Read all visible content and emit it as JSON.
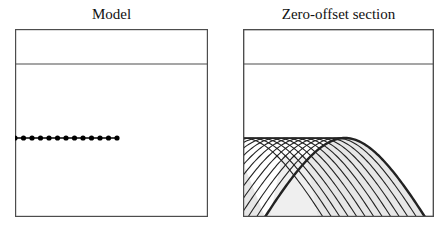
{
  "figure": {
    "kind": "seismic-model-and-zero-offset-section-diagram",
    "panels": [
      {
        "id": "model",
        "title": "Model",
        "frame": {
          "x": 15,
          "y": 29,
          "width": 193,
          "height": 188
        },
        "colors": {
          "border": "#4d4d4d",
          "background": "#ffffff",
          "ink": "#000000"
        }
      },
      {
        "id": "zero-offset-section",
        "title": "Zero-offset section",
        "frame": {
          "x": 243,
          "y": 29,
          "width": 191,
          "height": 188
        },
        "colors": {
          "border": "#4d4d4d",
          "background": "#ffffff",
          "fill": "#e7e7e7",
          "inner_fill": "#efefef",
          "curve": "#222222"
        }
      }
    ]
  },
  "chart_data": {
    "type": "scatter",
    "xlabel": "",
    "ylabel": "",
    "grid": false,
    "legend": "none",
    "panels": [
      {
        "name": "Model",
        "title": "Model",
        "xlim": [
          0,
          193
        ],
        "ylim": [
          0,
          188
        ],
        "elements": {
          "interface_line": {
            "description": "horizontal layer interface",
            "y": 35,
            "x_start": 0,
            "x_end": 193
          },
          "scatterer_points": {
            "description": "row of point diffractors",
            "y": 109,
            "count": 13,
            "x_start": 0,
            "x_end": 102,
            "spacing": 8.5,
            "marker_radius": 2.6,
            "x_values": [
              0,
              8.5,
              17,
              25.5,
              34,
              42.5,
              51,
              59.5,
              68,
              76.5,
              85,
              93.5,
              102
            ],
            "y_values": [
              109,
              109,
              109,
              109,
              109,
              109,
              109,
              109,
              109,
              109,
              109,
              109,
              109
            ]
          }
        }
      },
      {
        "name": "Zero-offset section",
        "title": "Zero-offset section",
        "xlim": [
          0,
          191
        ],
        "ylim": [
          0,
          188
        ],
        "elements": {
          "interface_line": {
            "description": "horizontal layer interface reflection",
            "y": 35,
            "x_start": 0,
            "x_end": 191
          },
          "diffraction_hyperbolas": {
            "description": "diffraction hyperbolas, one per point scatterer, apexes along a flat top at the scatterer depth",
            "count": 13,
            "apex_y": 109,
            "apex_x_values": [
              0,
              8.5,
              17,
              25.5,
              34,
              42.5,
              51,
              59.5,
              68,
              76.5,
              85,
              93.5,
              102
            ],
            "half_width": 80,
            "depth_extent": 79,
            "line_width": 1.1,
            "envelope_line_width": 2.4
          },
          "shaded_region": {
            "description": "gray shaded area beneath the diffraction envelope",
            "top_y": 109,
            "bottom_y": 188
          }
        }
      }
    ]
  }
}
